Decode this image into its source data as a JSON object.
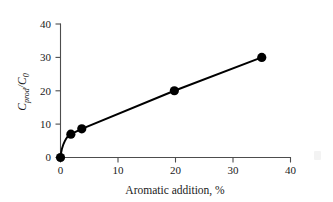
{
  "chart_data": {
    "type": "line",
    "title": "",
    "subtitle": "",
    "xlabel": "Aromatic addition, %",
    "ylabel": "Cprod/C0",
    "ylabel_parts": {
      "base1": "C",
      "sub1": "prod",
      "slash": "/",
      "base2": "C",
      "sub2": "0"
    },
    "xlim": [
      0,
      40
    ],
    "ylim": [
      0,
      40
    ],
    "xticks": [
      0,
      10,
      20,
      30,
      40
    ],
    "yticks": [
      0,
      10,
      20,
      30,
      40
    ],
    "xtick_labels": [
      "0",
      "10",
      "20",
      "30",
      "40"
    ],
    "ytick_labels": [
      "0",
      "10",
      "20",
      "30",
      "40"
    ],
    "grid": false,
    "legend": false,
    "legend_position": "none",
    "marker": "filled-circle",
    "marker_color": "#000000",
    "line_color": "#000000",
    "axis_color": "#4d4d4d",
    "background_color": "#ffffff",
    "series": [
      {
        "name": "Cprod/C0 vs aromatic addition",
        "x": [
          0,
          1.8,
          3.7,
          19.8,
          35.0
        ],
        "y": [
          0,
          7.0,
          8.6,
          20.0,
          30.0
        ]
      }
    ]
  },
  "figure": {
    "caption": "",
    "artifact_label": ""
  }
}
